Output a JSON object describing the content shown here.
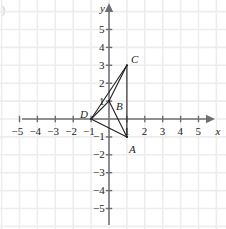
{
  "figure": {
    "corner_mark": ")",
    "axis_labels": {
      "x": "x",
      "y": "y"
    },
    "x_ticks": [
      {
        "value": -5,
        "label": "−5"
      },
      {
        "value": -4,
        "label": "−4"
      },
      {
        "value": -3,
        "label": "−3"
      },
      {
        "value": -2,
        "label": "−2"
      },
      {
        "value": -1,
        "label": "−1"
      },
      {
        "value": 1,
        "label": "1"
      },
      {
        "value": 2,
        "label": "2"
      },
      {
        "value": 3,
        "label": "3"
      },
      {
        "value": 4,
        "label": "4"
      },
      {
        "value": 5,
        "label": "5"
      }
    ],
    "y_ticks": [
      {
        "value": 5,
        "label": "5"
      },
      {
        "value": 4,
        "label": "4"
      },
      {
        "value": 3,
        "label": "3"
      },
      {
        "value": 2,
        "label": "2"
      },
      {
        "value": 1,
        "label": "1"
      },
      {
        "value": -1,
        "label": "−1"
      },
      {
        "value": -2,
        "label": "−2"
      },
      {
        "value": -3,
        "label": "−3"
      },
      {
        "value": -4,
        "label": "−4"
      },
      {
        "value": -5,
        "label": "−5"
      }
    ]
  },
  "chart_data": {
    "type": "scatter",
    "title": "",
    "xlabel": "x",
    "ylabel": "y",
    "xlim": [
      -5.9,
      6.2
    ],
    "ylim": [
      -5.9,
      6.1
    ],
    "grid": true,
    "legend": "none",
    "points": [
      {
        "name": "A",
        "x": 1,
        "y": -1,
        "label_dx": 2,
        "label_dy": 13
      },
      {
        "name": "B",
        "x": 0,
        "y": 1,
        "label_dx": 7,
        "label_dy": 6
      },
      {
        "name": "C",
        "x": 1,
        "y": 3,
        "label_dx": 4,
        "label_dy": -5
      },
      {
        "name": "D",
        "x": -1,
        "y": 0,
        "label_dx": -11,
        "label_dy": -4
      }
    ],
    "segments": [
      {
        "from": "D",
        "to": "C"
      },
      {
        "from": "D",
        "to": "B"
      },
      {
        "from": "D",
        "to": "A"
      },
      {
        "from": "B",
        "to": "C"
      },
      {
        "from": "B",
        "to": "A"
      },
      {
        "from": "A",
        "to": "C"
      }
    ],
    "colors": {
      "axis": "#6d6e71",
      "grid": "#ededed",
      "shape": "#231f20",
      "text": "#231f20"
    }
  }
}
